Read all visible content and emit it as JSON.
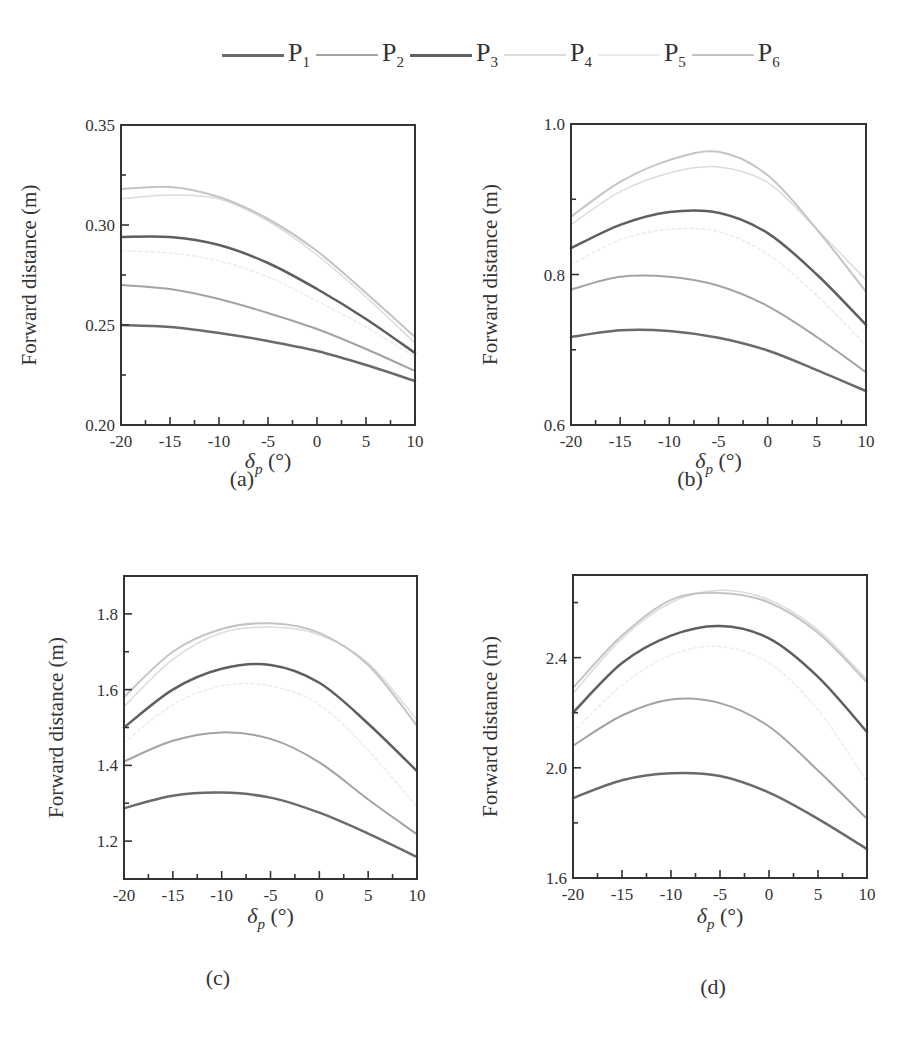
{
  "legend": [
    {
      "name": "P",
      "sub": "1",
      "color": "#6a6a6a",
      "width": 3
    },
    {
      "name": "P",
      "sub": "2",
      "color": "#a3a3a3",
      "width": 2.5
    },
    {
      "name": "P",
      "sub": "3",
      "color": "#5f5f5f",
      "width": 3
    },
    {
      "name": "P",
      "sub": "4",
      "color": "#dcdcdc",
      "width": 2
    },
    {
      "name": "P",
      "sub": "5",
      "color": "#ececec",
      "width": 2
    },
    {
      "name": "P",
      "sub": "6",
      "color": "#c4c4c4",
      "width": 2.5
    }
  ],
  "chart_data": [
    {
      "type": "line",
      "panel": "(a)",
      "title": "",
      "xlabel": "δp (°)",
      "ylabel": "Forward distance (m)",
      "x": [
        -20,
        -15,
        -10,
        -5,
        0,
        5,
        10
      ],
      "xlim": [
        -20,
        10
      ],
      "ylim": [
        0.2,
        0.35
      ],
      "yticks": [
        "0.20",
        "0.25",
        "0.30",
        "0.35"
      ],
      "xticks": [
        "-20",
        "-15",
        "-10",
        "-5",
        "0",
        "5",
        "10"
      ],
      "grid": false,
      "legend_position": "top",
      "series": [
        {
          "name": "P1",
          "values": [
            0.25,
            0.249,
            0.246,
            0.242,
            0.237,
            0.23,
            0.222
          ]
        },
        {
          "name": "P2",
          "values": [
            0.27,
            0.268,
            0.263,
            0.256,
            0.248,
            0.238,
            0.227
          ]
        },
        {
          "name": "P3",
          "values": [
            0.294,
            0.294,
            0.29,
            0.281,
            0.268,
            0.253,
            0.236
          ]
        },
        {
          "name": "P4",
          "values": [
            0.313,
            0.315,
            0.313,
            0.302,
            0.285,
            0.264,
            0.241
          ]
        },
        {
          "name": "P5",
          "values": [
            0.287,
            0.286,
            0.282,
            0.274,
            0.262,
            0.249,
            0.234
          ]
        },
        {
          "name": "P6",
          "values": [
            0.318,
            0.319,
            0.314,
            0.303,
            0.287,
            0.266,
            0.244
          ]
        }
      ]
    },
    {
      "type": "line",
      "panel": "(b)",
      "title": "",
      "xlabel": "δp (°)",
      "ylabel": "Forward distance (m)",
      "x": [
        -20,
        -15,
        -10,
        -5,
        0,
        5,
        10
      ],
      "xlim": [
        -20,
        10
      ],
      "ylim": [
        0.6,
        1.0
      ],
      "yticks": [
        "0.6",
        "0.8",
        "1.0"
      ],
      "xticks": [
        "-20",
        "-15",
        "-10",
        "-5",
        "0",
        "5",
        "10"
      ],
      "grid": false,
      "legend_position": "top",
      "series": [
        {
          "name": "P1",
          "values": [
            0.717,
            0.726,
            0.725,
            0.716,
            0.699,
            0.673,
            0.645
          ]
        },
        {
          "name": "P2",
          "values": [
            0.78,
            0.797,
            0.797,
            0.785,
            0.758,
            0.717,
            0.67
          ]
        },
        {
          "name": "P3",
          "values": [
            0.835,
            0.866,
            0.883,
            0.882,
            0.855,
            0.8,
            0.733
          ]
        },
        {
          "name": "P4",
          "values": [
            0.866,
            0.91,
            0.935,
            0.943,
            0.922,
            0.86,
            0.793
          ]
        },
        {
          "name": "P5",
          "values": [
            0.813,
            0.846,
            0.86,
            0.857,
            0.827,
            0.772,
            0.706
          ]
        },
        {
          "name": "P6",
          "values": [
            0.877,
            0.923,
            0.952,
            0.963,
            0.932,
            0.86,
            0.777
          ]
        }
      ]
    },
    {
      "type": "line",
      "panel": "(c)",
      "title": "",
      "xlabel": "δp (°)",
      "ylabel": "Forward distance (m)",
      "x": [
        -20,
        -15,
        -10,
        -5,
        0,
        5,
        10
      ],
      "xlim": [
        -20,
        10
      ],
      "ylim": [
        1.1,
        1.9
      ],
      "yticks": [
        "1.2",
        "1.4",
        "1.6",
        "1.8"
      ],
      "xticks": [
        "-20",
        "-15",
        "-10",
        "-5",
        "0",
        "5",
        "10"
      ],
      "grid": false,
      "legend_position": "top",
      "series": [
        {
          "name": "P1",
          "values": [
            1.287,
            1.32,
            1.328,
            1.315,
            1.275,
            1.22,
            1.158
          ]
        },
        {
          "name": "P2",
          "values": [
            1.41,
            1.465,
            1.487,
            1.47,
            1.408,
            1.31,
            1.218
          ]
        },
        {
          "name": "P3",
          "values": [
            1.5,
            1.6,
            1.655,
            1.665,
            1.618,
            1.51,
            1.385
          ]
        },
        {
          "name": "P4",
          "values": [
            1.555,
            1.68,
            1.75,
            1.765,
            1.745,
            1.67,
            1.52
          ]
        },
        {
          "name": "P5",
          "values": [
            1.46,
            1.56,
            1.61,
            1.61,
            1.56,
            1.44,
            1.29
          ]
        },
        {
          "name": "P6",
          "values": [
            1.58,
            1.7,
            1.76,
            1.775,
            1.75,
            1.665,
            1.505
          ]
        }
      ]
    },
    {
      "type": "line",
      "panel": "(d)",
      "title": "",
      "xlabel": "δp (°)",
      "ylabel": "Forward distance (m)",
      "x": [
        -20,
        -15,
        -10,
        -5,
        0,
        5,
        10
      ],
      "xlim": [
        -20,
        10
      ],
      "ylim": [
        1.6,
        2.7
      ],
      "yticks": [
        "1.6",
        "2.0",
        "2.4"
      ],
      "xticks": [
        "-20",
        "-15",
        "-10",
        "-5",
        "0",
        "5",
        "10"
      ],
      "grid": false,
      "legend_position": "top",
      "series": [
        {
          "name": "P1",
          "values": [
            1.89,
            1.955,
            1.98,
            1.97,
            1.91,
            1.815,
            1.705
          ]
        },
        {
          "name": "P2",
          "values": [
            2.08,
            2.19,
            2.248,
            2.235,
            2.15,
            1.99,
            1.815
          ]
        },
        {
          "name": "P3",
          "values": [
            2.2,
            2.38,
            2.48,
            2.515,
            2.47,
            2.33,
            2.13
          ]
        },
        {
          "name": "P4",
          "values": [
            2.27,
            2.47,
            2.6,
            2.645,
            2.61,
            2.5,
            2.32
          ]
        },
        {
          "name": "P5",
          "values": [
            2.13,
            2.3,
            2.41,
            2.44,
            2.38,
            2.21,
            1.95
          ]
        },
        {
          "name": "P6",
          "values": [
            2.29,
            2.48,
            2.61,
            2.635,
            2.6,
            2.49,
            2.31
          ]
        }
      ]
    }
  ],
  "panels_layout": [
    {
      "left": 121,
      "top": 125,
      "right": 415,
      "bottom": 425,
      "ylabel_x": 36,
      "caption_x": 242,
      "caption_y": 486,
      "xlabel_y": 468,
      "minor_y": [
        0.225,
        0.275,
        0.325
      ]
    },
    {
      "left": 571,
      "top": 124,
      "right": 866,
      "bottom": 425,
      "ylabel_x": 497,
      "caption_x": 690,
      "caption_y": 486,
      "xlabel_y": 468,
      "minor_y": [
        0.7,
        0.9
      ]
    },
    {
      "left": 124,
      "top": 576,
      "right": 417,
      "bottom": 879,
      "ylabel_x": 63,
      "caption_x": 218,
      "caption_y": 985,
      "xlabel_y": 923,
      "minor_y": [
        1.3,
        1.5,
        1.7
      ]
    },
    {
      "left": 573,
      "top": 575,
      "right": 867,
      "bottom": 878,
      "ylabel_x": 497,
      "caption_x": 713,
      "caption_y": 994,
      "xlabel_y": 923,
      "minor_y": [
        1.8,
        2.2,
        2.6
      ]
    }
  ]
}
